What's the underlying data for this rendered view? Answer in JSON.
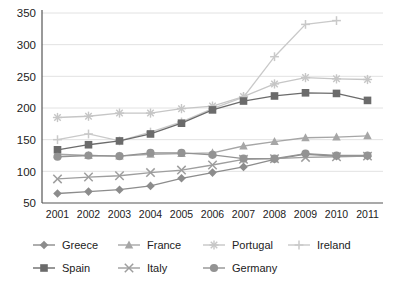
{
  "chart_data": {
    "type": "line",
    "title": "",
    "subtitle": "",
    "xlabel": "",
    "ylabel": "",
    "x": [
      "2001",
      "2002",
      "2003",
      "2004",
      "2005",
      "2006",
      "2007",
      "2008",
      "2009",
      "2010",
      "2011"
    ],
    "categories": [
      "2001",
      "2002",
      "2003",
      "2004",
      "2005",
      "2006",
      "2007",
      "2008",
      "2009",
      "2010",
      "2011"
    ],
    "ylim": [
      50,
      350
    ],
    "yticks": [
      50,
      100,
      150,
      200,
      250,
      300,
      350
    ],
    "ytick_labels": [
      "50",
      "100",
      "150",
      "200",
      "250",
      "300",
      "350"
    ],
    "grid": true,
    "grid_axis": "y",
    "legend_position": "bottom",
    "legend_columns": 4,
    "series": [
      {
        "name": "Greece",
        "marker": "diamond",
        "color": "#8c8c8c",
        "values": [
          65,
          68,
          71,
          77,
          89,
          98,
          107,
          119,
          127,
          124,
          124
        ]
      },
      {
        "name": "France",
        "marker": "triangle",
        "color": "#a6a6a6",
        "values": [
          127,
          125,
          124,
          127,
          128,
          129,
          140,
          147,
          153,
          154,
          156
        ]
      },
      {
        "name": "Portugal",
        "marker": "asterisk",
        "color": "#c6c6c6",
        "values": [
          185,
          187,
          192,
          192,
          199,
          203,
          218,
          238,
          248,
          246,
          245
        ]
      },
      {
        "name": "Ireland",
        "marker": "plus",
        "color": "#c9c9c9",
        "values": [
          150,
          159,
          148,
          162,
          178,
          199,
          217,
          281,
          332,
          338,
          null
        ]
      },
      {
        "name": "Spain",
        "marker": "square",
        "color": "#6b6b6b",
        "values": [
          134,
          142,
          148,
          159,
          176,
          197,
          211,
          219,
          224,
          223,
          212
        ]
      },
      {
        "name": "Italy",
        "marker": "cross",
        "color": "#9e9e9e",
        "values": [
          88,
          91,
          93,
          98,
          102,
          110,
          119,
          120,
          122,
          123,
          124
        ]
      },
      {
        "name": "Germany",
        "marker": "circle",
        "color": "#939393",
        "values": [
          123,
          125,
          124,
          129,
          129,
          126,
          120,
          120,
          128,
          125,
          125
        ]
      }
    ]
  },
  "legend": {
    "items": [
      {
        "label": "Greece",
        "marker": "diamond",
        "color": "#8c8c8c"
      },
      {
        "label": "France",
        "marker": "triangle",
        "color": "#a6a6a6"
      },
      {
        "label": "Portugal",
        "marker": "asterisk",
        "color": "#c6c6c6"
      },
      {
        "label": "Ireland",
        "marker": "plus",
        "color": "#c9c9c9"
      },
      {
        "label": "Spain",
        "marker": "square",
        "color": "#6b6b6b"
      },
      {
        "label": "Italy",
        "marker": "cross",
        "color": "#9e9e9e"
      },
      {
        "label": "Germany",
        "marker": "circle",
        "color": "#939393"
      }
    ]
  },
  "axes": {
    "y_axis_color": "#555555",
    "x_axis_color": "#555555",
    "grid_color": "#e2e2e2"
  }
}
